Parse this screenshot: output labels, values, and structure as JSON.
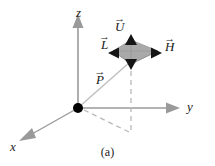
{
  "figure": {
    "caption": "(a)",
    "background_color": "#ffffff",
    "axes": [
      {
        "name": "z",
        "label": "z",
        "direction": "up"
      },
      {
        "name": "y",
        "label": "y",
        "direction": "right"
      },
      {
        "name": "x",
        "label": "x",
        "direction": "lower-left"
      }
    ],
    "vectors": [
      {
        "name": "U",
        "label": "U",
        "accent": "→",
        "direction": "up",
        "description": "up vector"
      },
      {
        "name": "L",
        "label": "L",
        "accent": "→",
        "direction": "left",
        "description": "light vector"
      },
      {
        "name": "H",
        "label": "H",
        "accent": "→",
        "direction": "right",
        "description": "half vector"
      },
      {
        "name": "P",
        "label": "P",
        "accent": "→",
        "direction": "diagonal-up-right",
        "description": "position vector"
      }
    ],
    "origin": {
      "label": "",
      "marker": "filled-dot"
    },
    "patch": {
      "name": "shaded-diamond",
      "fill_color": "#a8a8a8",
      "edge_color": "#8c8c8c"
    },
    "colors": {
      "axis": "#9a9a9a",
      "arrowhead": "#1c1c1c",
      "dashed": "#b4b4b4",
      "text": "#1a1a1a",
      "origin_dot": "#000000",
      "patch_fill": "#a8a8a8"
    }
  }
}
